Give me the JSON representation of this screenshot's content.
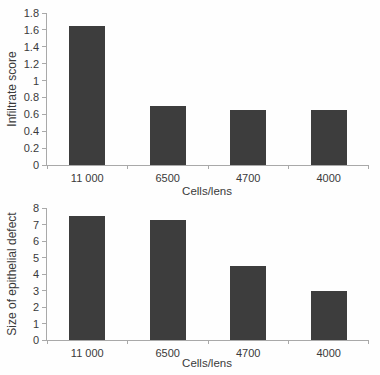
{
  "figure": {
    "background": "#fefefe",
    "bar_color": "#3d3d3d",
    "axis_color": "#a9a9a9",
    "text_color": "#3a3a3a"
  },
  "chart_data": [
    {
      "type": "bar",
      "title": "",
      "categories": [
        "11 000",
        "6500",
        "4700",
        "4000"
      ],
      "values": [
        1.65,
        0.7,
        0.65,
        0.65
      ],
      "xlabel": "Cells/lens",
      "ylabel": "Infiltrate score",
      "ylim": [
        0,
        1.8
      ],
      "y_ticks": [
        0,
        0.2,
        0.4,
        0.6,
        0.8,
        1,
        1.2,
        1.4,
        1.6,
        1.8
      ],
      "y_tick_labels": [
        "0",
        "0.2",
        "0.4",
        "0.6",
        "0.8",
        "1",
        "1.2",
        "1.4",
        "1.6",
        "1.8"
      ],
      "grid": false,
      "legend": false
    },
    {
      "type": "bar",
      "title": "",
      "categories": [
        "11 000",
        "6500",
        "4700",
        "4000"
      ],
      "values": [
        7.5,
        7.3,
        4.5,
        3.0
      ],
      "xlabel": "Cells/lens",
      "ylabel": "Size of epithelial defect",
      "ylim": [
        0,
        8
      ],
      "y_ticks": [
        0,
        1,
        2,
        3,
        4,
        5,
        6,
        7,
        8
      ],
      "y_tick_labels": [
        "0",
        "1",
        "2",
        "3",
        "4",
        "5",
        "6",
        "7",
        "8"
      ],
      "grid": false,
      "legend": false
    }
  ],
  "layout": {
    "charts": [
      {
        "plot_left": 46,
        "plot_top": 13,
        "plot_width": 322,
        "plot_height": 152,
        "ylabel_x": 12,
        "xlabel_top": 185,
        "bar_width": 36
      },
      {
        "plot_left": 46,
        "plot_top": 208,
        "plot_width": 322,
        "plot_height": 132,
        "ylabel_x": 12,
        "xlabel_top": 357,
        "bar_width": 36
      }
    ]
  }
}
